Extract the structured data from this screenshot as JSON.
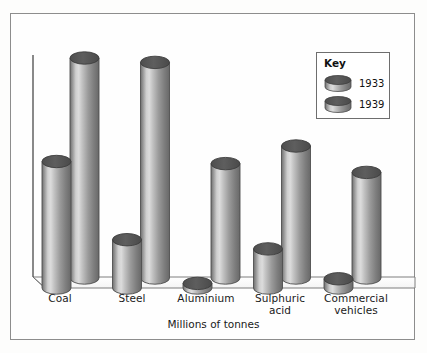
{
  "chart_data": {
    "type": "bar",
    "title": "",
    "subtitle": "",
    "xlabel": "Millions of tonnes",
    "ylabel": "",
    "categories": [
      "Coal",
      "Steel",
      "Aluminium",
      "Sulphuric\nacid",
      "Commercial\nvehicles"
    ],
    "series": [
      {
        "name": "1933",
        "values": [
          55,
          21,
          2,
          17,
          4
        ]
      },
      {
        "name": "1939",
        "values": [
          100,
          98,
          52,
          60,
          48
        ]
      }
    ],
    "ylim": [
      0,
      100
    ],
    "grid": false,
    "legend": {
      "title": "Key",
      "position": "top-right",
      "entries": [
        "1933",
        "1939"
      ]
    },
    "style": "3d-cylinder"
  },
  "axis": {
    "title": "Millions of tonnes"
  },
  "legend": {
    "title": "Key",
    "entries": [
      {
        "label": "1933"
      },
      {
        "label": "1939"
      }
    ]
  },
  "colors": {
    "frame": "#8d8d8d",
    "axis": "#4a4a4a",
    "cylinder_cap": "#555555",
    "cylinder_light": "#d8d8d8",
    "cylinder_dark": "#6a6a6a",
    "background": "#fdfdfc",
    "text": "#1a1a1a"
  }
}
